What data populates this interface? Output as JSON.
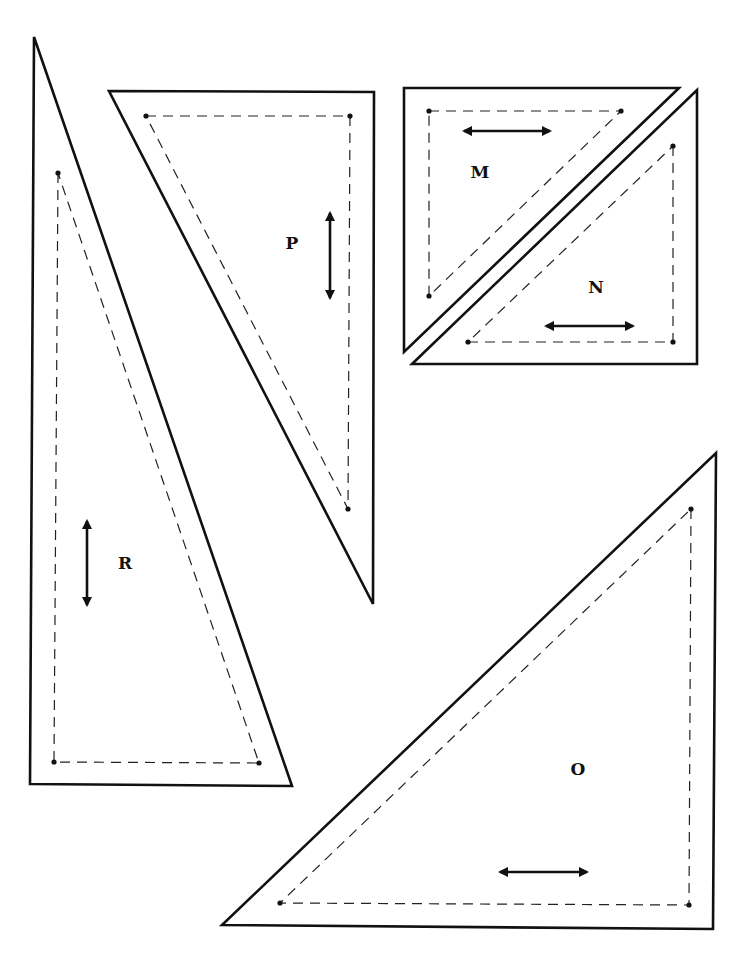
{
  "diagram": {
    "type": "quilt-pattern-templates",
    "colors": {
      "background": "#ffffff",
      "line": "#111111"
    },
    "pieces": [
      {
        "id": "R",
        "label": "R",
        "outline": [
          [
            34,
            37
          ],
          [
            30,
            784
          ],
          [
            292,
            786
          ]
        ],
        "seam": [
          [
            58,
            173
          ],
          [
            54,
            762
          ],
          [
            259,
            763
          ]
        ],
        "grain": {
          "direction": "vertical",
          "x1": 87,
          "y1": 521,
          "x2": 87,
          "y2": 605
        },
        "label_pos": [
          125,
          569
        ]
      },
      {
        "id": "P",
        "label": "P",
        "outline": [
          [
            109,
            91
          ],
          [
            374,
            92
          ],
          [
            373,
            604
          ]
        ],
        "seam": [
          [
            146,
            116
          ],
          [
            350,
            116
          ],
          [
            348,
            509
          ]
        ],
        "grain": {
          "direction": "vertical",
          "x1": 330,
          "y1": 213,
          "x2": 330,
          "y2": 298
        },
        "label_pos": [
          292,
          249
        ]
      },
      {
        "id": "M",
        "label": "M",
        "outline": [
          [
            404,
            88
          ],
          [
            679,
            88
          ],
          [
            404,
            352
          ]
        ],
        "seam": [
          [
            429,
            111
          ],
          [
            621,
            111
          ],
          [
            429,
            296
          ]
        ],
        "grain": {
          "direction": "horizontal",
          "x1": 464,
          "y1": 131,
          "x2": 550,
          "y2": 131
        },
        "label_pos": [
          480,
          178
        ]
      },
      {
        "id": "N",
        "label": "N",
        "outline": [
          [
            697,
            90
          ],
          [
            697,
            364
          ],
          [
            412,
            364
          ]
        ],
        "seam": [
          [
            673,
            146
          ],
          [
            673,
            342
          ],
          [
            468,
            342
          ]
        ],
        "grain": {
          "direction": "horizontal",
          "x1": 546,
          "y1": 326,
          "x2": 633,
          "y2": 326
        },
        "label_pos": [
          596,
          293
        ]
      },
      {
        "id": "O",
        "label": "O",
        "outline": [
          [
            716,
            453
          ],
          [
            713,
            929
          ],
          [
            222,
            925
          ]
        ],
        "seam": [
          [
            691,
            509
          ],
          [
            689,
            905
          ],
          [
            280,
            903
          ]
        ],
        "grain": {
          "direction": "horizontal",
          "x1": 500,
          "y1": 872,
          "x2": 587,
          "y2": 872
        },
        "label_pos": [
          578,
          775
        ]
      }
    ]
  }
}
